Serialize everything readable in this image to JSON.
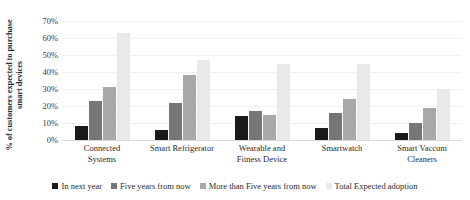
{
  "chart_data": {
    "type": "bar",
    "title": "",
    "xlabel": "",
    "ylabel": "% of customers expected to purchase smart devices",
    "ylim": [
      0,
      70
    ],
    "ytick_labels": [
      "70%",
      "60%",
      "50%",
      "40%",
      "30%",
      "20%",
      "10%",
      "0%"
    ],
    "ytick_values": [
      70,
      60,
      50,
      40,
      30,
      20,
      10,
      0
    ],
    "grid": true,
    "legend_position": "bottom",
    "categories": [
      "Connected Systems",
      "Smart Refrigerator",
      "Wearable and Fitness Device",
      "Smartwatch",
      "Smart Vaccum Cleaners"
    ],
    "category_lines": [
      [
        "Connected",
        "Systems"
      ],
      [
        "Smart Refrigerator"
      ],
      [
        "Wearable and",
        "Fitness Device"
      ],
      [
        "Smartwatch"
      ],
      [
        "Smart Vaccum",
        "Cleaners"
      ]
    ],
    "series": [
      {
        "name": "In next year",
        "color": "#1a1a1a",
        "values": [
          8,
          6,
          14,
          7,
          4
        ]
      },
      {
        "name": "Five years from now",
        "color": "#767676",
        "values": [
          23,
          22,
          17,
          16,
          10
        ]
      },
      {
        "name": "More than Five years from now",
        "color": "#a8a8a8",
        "values": [
          31,
          38,
          15,
          24,
          19
        ]
      },
      {
        "name": "Total Expected adoption",
        "color": "#e9e9e9",
        "values": [
          63,
          47,
          45,
          45,
          30
        ]
      }
    ]
  },
  "axis": {
    "y_title_line1": "% of customers expected to purchase",
    "y_title_line2": "smart devices"
  }
}
